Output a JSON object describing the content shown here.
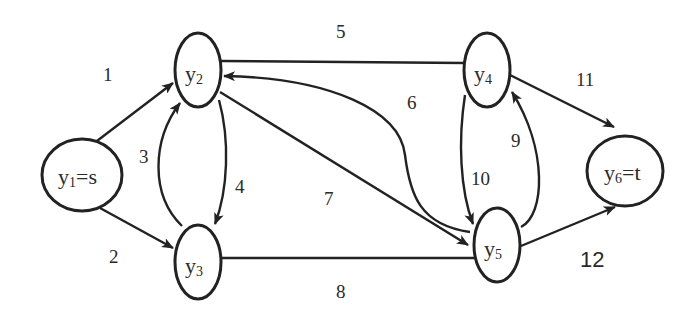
{
  "diagram": {
    "type": "directed flow network",
    "colors": {
      "stroke": "#222222",
      "background": "#ffffff",
      "text": "#2a2a2a"
    },
    "nodes": [
      {
        "id": "y1",
        "base": "y",
        "sub": "1",
        "suffix": "=s"
      },
      {
        "id": "y2",
        "base": "y",
        "sub": "2",
        "suffix": ""
      },
      {
        "id": "y3",
        "base": "y",
        "sub": "3",
        "suffix": ""
      },
      {
        "id": "y4",
        "base": "y",
        "sub": "4",
        "suffix": ""
      },
      {
        "id": "y5",
        "base": "y",
        "sub": "5",
        "suffix": ""
      },
      {
        "id": "y6",
        "base": "y",
        "sub": "6",
        "suffix": "=t"
      }
    ],
    "edges": [
      {
        "label": "1",
        "from": "y1",
        "to": "y2"
      },
      {
        "label": "2",
        "from": "y1",
        "to": "y3"
      },
      {
        "label": "3",
        "from": "y3",
        "to": "y2"
      },
      {
        "label": "4",
        "from": "y2",
        "to": "y3"
      },
      {
        "label": "5",
        "from": "y2",
        "to": "y4"
      },
      {
        "label": "6",
        "from": "y5",
        "to": "y2"
      },
      {
        "label": "7",
        "from": "y2",
        "to": "y5"
      },
      {
        "label": "8",
        "from": "y3",
        "to": "y5"
      },
      {
        "label": "9",
        "from": "y5",
        "to": "y4"
      },
      {
        "label": "10",
        "from": "y4",
        "to": "y5"
      },
      {
        "label": "11",
        "from": "y4",
        "to": "y6"
      },
      {
        "label": "12",
        "from": "y5",
        "to": "y6"
      }
    ]
  }
}
